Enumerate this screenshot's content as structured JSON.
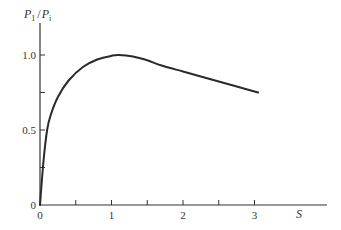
{
  "chart_data": {
    "type": "line",
    "title": "",
    "xlabel": "S",
    "ylabel": "P1 / Pi",
    "ylabel_parts": {
      "num_main": "P",
      "num_sub": "1",
      "sep": "/",
      "den_main": "P",
      "den_sub": "i"
    },
    "xlim": [
      0,
      3.9
    ],
    "ylim": [
      0,
      1.2
    ],
    "grid": false,
    "legend": null,
    "x_ticks": [
      0,
      0.5,
      1,
      1.5,
      2,
      2.5,
      3
    ],
    "x_tick_labels": [
      {
        "value": 0,
        "label": "0"
      },
      {
        "value": 1,
        "label": "1"
      },
      {
        "value": 2,
        "label": "2"
      },
      {
        "value": 3,
        "label": "3"
      }
    ],
    "y_ticks": [
      0,
      0.25,
      0.5,
      0.75,
      1.0
    ],
    "y_tick_labels": [
      {
        "value": 0,
        "label": "0"
      },
      {
        "value": 0.5,
        "label": "0.5"
      },
      {
        "value": 1.0,
        "label": "1.0"
      }
    ],
    "series": [
      {
        "name": "P1/Pi vs S",
        "color": "#2a2a2a",
        "x": [
          0,
          0.05,
          0.1,
          0.15,
          0.25,
          0.4,
          0.6,
          0.8,
          1.0,
          1.1,
          1.3,
          1.5,
          1.7,
          2.0,
          2.3,
          2.6,
          2.9,
          3.05
        ],
        "y": [
          0,
          0.3,
          0.5,
          0.6,
          0.72,
          0.83,
          0.92,
          0.97,
          0.995,
          1.0,
          0.99,
          0.965,
          0.93,
          0.89,
          0.85,
          0.81,
          0.77,
          0.75
        ]
      }
    ]
  }
}
